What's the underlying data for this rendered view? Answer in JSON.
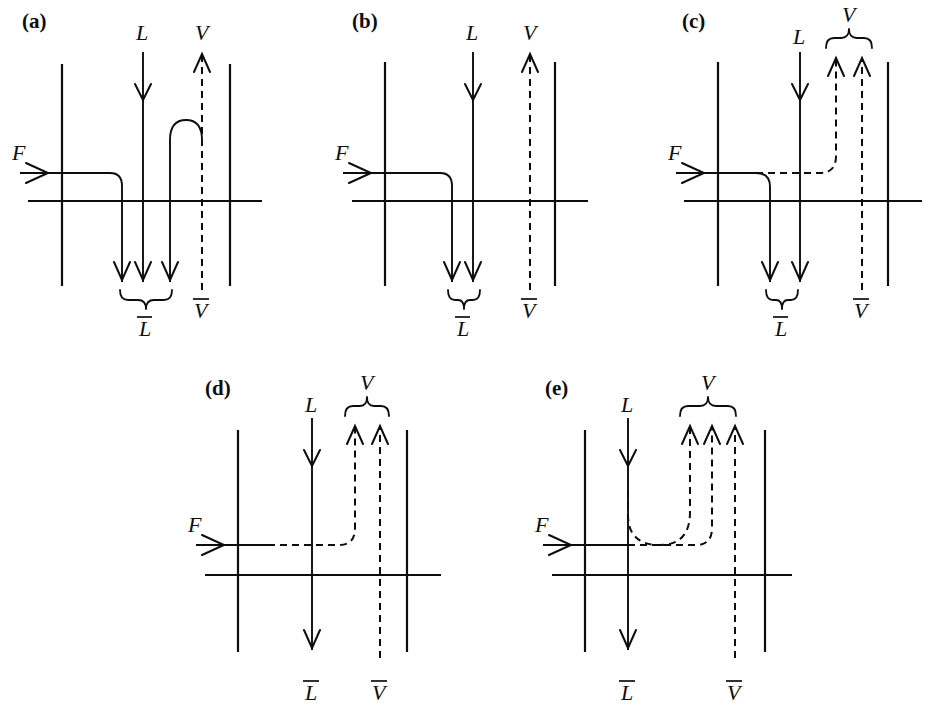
{
  "figure": {
    "type": "schematic-diagram",
    "panel_labels": [
      "(a)",
      "(b)",
      "(c)",
      "(d)",
      "(e)"
    ],
    "symbols": {
      "feed": "F",
      "liquid": "L",
      "vapor": "V",
      "liquid_bar": "L",
      "vapor_bar": "V"
    }
  },
  "panels": [
    {
      "id": "a",
      "label": "(a)",
      "top_labels": [
        {
          "text": "L",
          "overbar": false
        },
        {
          "text": "V",
          "overbar": false
        }
      ],
      "left_label": {
        "text": "F",
        "overbar": false
      },
      "bottom_labels": [
        {
          "text": "L",
          "overbar": true
        },
        {
          "text": "V",
          "overbar": true
        }
      ],
      "bottom_brace": {
        "present": true,
        "arrow_count": 3
      },
      "top_brace": {
        "present": false,
        "arrow_count": 0
      },
      "feed_style": "solid",
      "vapor_style": "dashed",
      "note": "Feed line turns down into liquid; a solid arc rises and joins the vapor line"
    },
    {
      "id": "b",
      "label": "(b)",
      "top_labels": [
        {
          "text": "L",
          "overbar": false
        },
        {
          "text": "V",
          "overbar": false
        }
      ],
      "left_label": {
        "text": "F",
        "overbar": false
      },
      "bottom_labels": [
        {
          "text": "L",
          "overbar": true
        },
        {
          "text": "V",
          "overbar": true
        }
      ],
      "bottom_brace": {
        "present": true,
        "arrow_count": 2
      },
      "top_brace": {
        "present": false,
        "arrow_count": 0
      },
      "feed_style": "solid",
      "vapor_style": "dashed",
      "note": "Feed line turns down and joins liquid only; vapor passes straight through"
    },
    {
      "id": "c",
      "label": "(c)",
      "top_labels": [
        {
          "text": "L",
          "overbar": false
        },
        {
          "text": "V",
          "overbar": false
        }
      ],
      "left_label": {
        "text": "F",
        "overbar": false
      },
      "bottom_labels": [
        {
          "text": "L",
          "overbar": true
        },
        {
          "text": "V",
          "overbar": true
        }
      ],
      "bottom_brace": {
        "present": true,
        "arrow_count": 2
      },
      "top_brace": {
        "present": true,
        "arrow_count": 2
      },
      "feed_style": "mixed",
      "vapor_style": "dashed",
      "note": "Feed splits: solid branch down to liquid, dashed branch rises into vapor"
    },
    {
      "id": "d",
      "label": "(d)",
      "top_labels": [
        {
          "text": "L",
          "overbar": false
        },
        {
          "text": "V",
          "overbar": false
        }
      ],
      "left_label": {
        "text": "F",
        "overbar": false
      },
      "bottom_labels": [
        {
          "text": "L",
          "overbar": true
        },
        {
          "text": "V",
          "overbar": true
        }
      ],
      "bottom_brace": {
        "present": false,
        "arrow_count": 1
      },
      "top_brace": {
        "present": true,
        "arrow_count": 2
      },
      "feed_style": "dashed",
      "vapor_style": "dashed",
      "note": "Entire feed rises as vapor; liquid passes straight down"
    },
    {
      "id": "e",
      "label": "(e)",
      "top_labels": [
        {
          "text": "L",
          "overbar": false
        },
        {
          "text": "V",
          "overbar": false
        }
      ],
      "left_label": {
        "text": "F",
        "overbar": false
      },
      "bottom_labels": [
        {
          "text": "L",
          "overbar": true
        },
        {
          "text": "V",
          "overbar": true
        }
      ],
      "bottom_brace": {
        "present": false,
        "arrow_count": 1
      },
      "top_brace": {
        "present": true,
        "arrow_count": 3
      },
      "feed_style": "dashed",
      "vapor_style": "dashed",
      "note": "Feed and part of the liquid vaporize; dashed U-curve from liquid joins the vapor stream"
    }
  ],
  "style": {
    "line_color": "#0d0d0d",
    "background": "#ffffff"
  }
}
